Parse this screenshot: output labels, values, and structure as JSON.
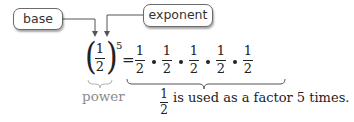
{
  "labels": {
    "base": "base",
    "exponent": "exponent",
    "power": "power"
  },
  "expression": {
    "base_numerator": "1",
    "base_denominator": "2",
    "exponent": "5",
    "equals": "=",
    "factors": [
      {
        "numerator": "1",
        "denominator": "2"
      },
      {
        "numerator": "1",
        "denominator": "2"
      },
      {
        "numerator": "1",
        "denominator": "2"
      },
      {
        "numerator": "1",
        "denominator": "2"
      },
      {
        "numerator": "1",
        "denominator": "2"
      }
    ],
    "operator": "•"
  },
  "explanation": {
    "fraction_numerator": "1",
    "fraction_denominator": "2",
    "text": "is used as a factor 5 times."
  },
  "colors": {
    "text": "#222222",
    "box_border": "#6b6b6b",
    "power_label": "#8a8a8a",
    "brace": "#b5b5b5"
  }
}
